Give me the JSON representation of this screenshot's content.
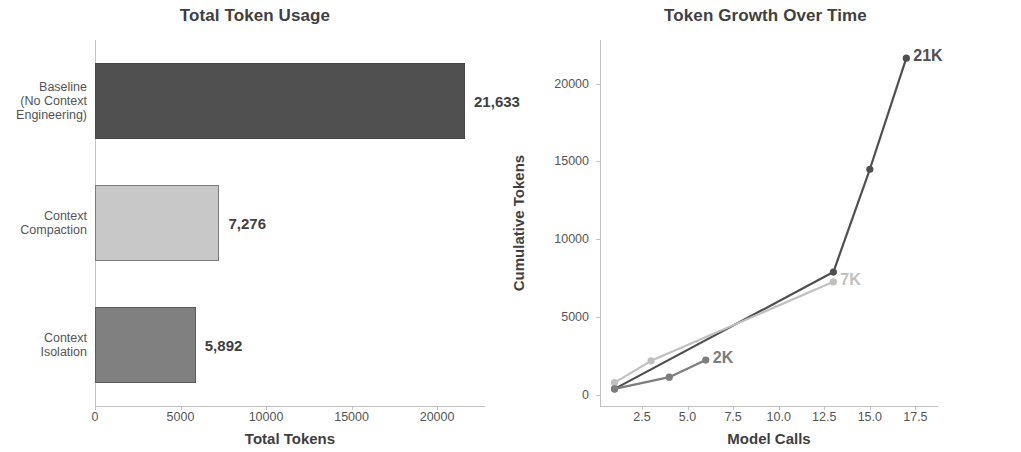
{
  "chart_data": [
    {
      "type": "bar",
      "orientation": "horizontal",
      "title": "Total Token Usage",
      "xlabel": "Total Tokens",
      "ylabel": "",
      "categories": [
        "Baseline\n(No Context\nEngineering)",
        "Context\nCompaction",
        "Context\nIsolation"
      ],
      "category_lines": [
        [
          "Baseline",
          "(No Context",
          "Engineering)"
        ],
        [
          "Context",
          "Compaction"
        ],
        [
          "Context",
          "Isolation"
        ]
      ],
      "values": [
        21633,
        7276,
        5892
      ],
      "value_labels": [
        "21,633",
        "7,276",
        "5,892"
      ],
      "colors": [
        "#505050",
        "#c8c8c8",
        "#808080"
      ],
      "xlim": [
        0,
        22800
      ],
      "xticks": [
        0,
        5000,
        10000,
        15000,
        20000
      ],
      "xtick_labels": [
        "0",
        "5000",
        "10000",
        "15000",
        "20000"
      ],
      "grid": false
    },
    {
      "type": "line",
      "title": "Token Growth Over Time",
      "xlabel": "Model Calls",
      "ylabel": "Cumulative Tokens",
      "xlim": [
        0.2,
        18.3
      ],
      "ylim": [
        -700,
        22800
      ],
      "xticks": [
        2.5,
        5.0,
        7.5,
        10.0,
        12.5,
        15.0,
        17.5
      ],
      "xtick_labels": [
        "2.5",
        "5.0",
        "7.5",
        "10.0",
        "12.5",
        "15.0",
        "17.5"
      ],
      "yticks": [
        0,
        5000,
        10000,
        15000,
        20000
      ],
      "ytick_labels": [
        "0",
        "5000",
        "10000",
        "15000",
        "20000"
      ],
      "grid": false,
      "legend_position": "upper left",
      "series": [
        {
          "name": "Baseline (No Management)",
          "color": "#4f4f4f",
          "x": [
            1,
            13,
            15,
            17
          ],
          "y": [
            400,
            7900,
            14500,
            21633
          ],
          "end_label": "21K"
        },
        {
          "name": "Context Compaction",
          "color": "#c0c0c0",
          "x": [
            1,
            3,
            13
          ],
          "y": [
            800,
            2200,
            7276
          ],
          "end_label": "7K"
        },
        {
          "name": "Context Isolation",
          "color": "#7d7d7d",
          "x": [
            1,
            4,
            6
          ],
          "y": [
            400,
            1150,
            2250
          ],
          "end_label": "2K"
        }
      ]
    }
  ],
  "bar_panel": {
    "title": "Total Token Usage",
    "xlabel": "Total Tokens"
  },
  "line_panel": {
    "title": "Token Growth Over Time",
    "xlabel": "Model Calls",
    "ylabel": "Cumulative Tokens"
  }
}
